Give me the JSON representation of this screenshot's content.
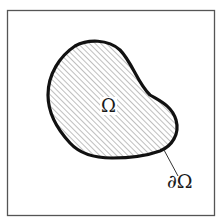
{
  "diagram": {
    "region_label": "Ω",
    "boundary_label": "∂Ω",
    "colors": {
      "frame": "#555555",
      "outline": "#111111",
      "hatch": "#8a8a8a",
      "background": "#ffffff"
    },
    "elements": [
      {
        "name": "frame",
        "type": "rectangle"
      },
      {
        "name": "domain-region",
        "type": "hatched-blob",
        "label": "Ω"
      },
      {
        "name": "boundary-leader-line",
        "type": "line",
        "label": "∂Ω"
      }
    ]
  }
}
